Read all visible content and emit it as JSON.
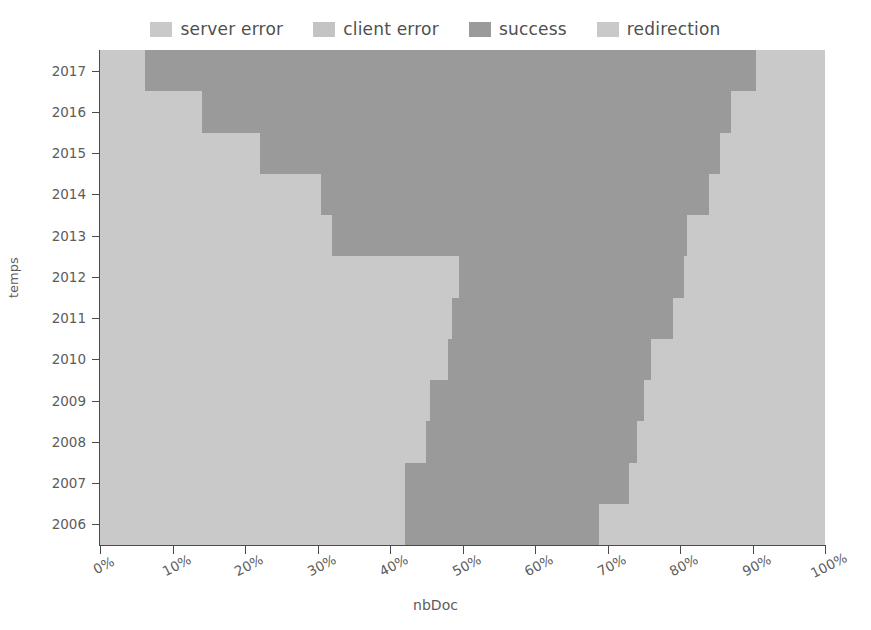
{
  "chart_data": {
    "type": "area",
    "subtype": "stacked-percentage-step-area-horizontal",
    "title": "",
    "xlabel": "nbDoc",
    "ylabel": "temps",
    "xlim": [
      0,
      100
    ],
    "x_unit": "%",
    "grid": false,
    "legend_position": "top-center",
    "orientation": "horizontal",
    "categories": [
      "2006",
      "2007",
      "2008",
      "2009",
      "2010",
      "2011",
      "2012",
      "2013",
      "2014",
      "2015",
      "2016",
      "2017"
    ],
    "xticks": [
      0,
      10,
      20,
      30,
      40,
      50,
      60,
      70,
      80,
      90,
      100
    ],
    "xticklabels": [
      "0%",
      "10%",
      "20%",
      "30%",
      "40%",
      "50%",
      "60%",
      "70%",
      "80%",
      "90%",
      "100%"
    ],
    "series": [
      {
        "name": "server error",
        "color": "#c9c9c9",
        "values": [
          42.0,
          42.0,
          45.0,
          45.5,
          48.0,
          48.5,
          49.5,
          32.0,
          30.5,
          22.0,
          14.0,
          6.2
        ]
      },
      {
        "name": "client error",
        "color": "#c0c0c0",
        "values": [
          0.0,
          0.0,
          0.0,
          0.0,
          0.0,
          0.0,
          0.0,
          0.0,
          0.0,
          0.0,
          0.0,
          0.0
        ]
      },
      {
        "name": "success",
        "color": "#9a9a9a",
        "values": [
          26.8,
          31.0,
          29.0,
          29.5,
          28.0,
          30.5,
          31.0,
          49.0,
          53.5,
          63.5,
          73.0,
          84.3
        ]
      },
      {
        "name": "redirection",
        "color": "#c9c9c9",
        "values": [
          31.2,
          27.0,
          26.0,
          25.0,
          24.0,
          21.0,
          19.5,
          19.0,
          16.0,
          14.5,
          13.0,
          9.5
        ]
      }
    ],
    "stack_boundaries": [
      {
        "year": "2017",
        "start": 6.2,
        "end": 90.5
      },
      {
        "year": "2016",
        "start": 14.0,
        "end": 87.0
      },
      {
        "year": "2015",
        "start": 22.0,
        "end": 85.5
      },
      {
        "year": "2014",
        "start": 30.5,
        "end": 84.0
      },
      {
        "year": "2013",
        "start": 32.0,
        "end": 81.0
      },
      {
        "year": "2012",
        "start": 49.5,
        "end": 80.5
      },
      {
        "year": "2011",
        "start": 48.5,
        "end": 79.0
      },
      {
        "year": "2010",
        "start": 48.0,
        "end": 76.0
      },
      {
        "year": "2009",
        "start": 45.5,
        "end": 75.0
      },
      {
        "year": "2008",
        "start": 45.0,
        "end": 74.0
      },
      {
        "year": "2007",
        "start": 42.0,
        "end": 73.0
      },
      {
        "year": "2006",
        "start": 42.0,
        "end": 68.8
      }
    ],
    "sub_steps": [
      {
        "year": "2017",
        "rows": [
          [
            0,
            6.2,
            "light"
          ],
          [
            6.2,
            90.5,
            "dark"
          ],
          [
            90.5,
            100,
            "light"
          ]
        ]
      },
      {
        "year": "2016",
        "rows": [
          [
            0,
            14.0,
            "light"
          ],
          [
            14.0,
            87.0,
            "dark"
          ],
          [
            87.0,
            100,
            "light"
          ]
        ]
      },
      {
        "year": "2015",
        "rows": [
          [
            0,
            22.0,
            "light"
          ],
          [
            22.0,
            85.5,
            "dark"
          ],
          [
            85.5,
            100,
            "light"
          ]
        ]
      },
      {
        "year": "2014",
        "rows": [
          [
            0,
            30.5,
            "light"
          ],
          [
            30.5,
            84.0,
            "dark"
          ],
          [
            84.0,
            100,
            "light"
          ]
        ]
      },
      {
        "year": "2013",
        "rows": [
          [
            0,
            32.0,
            "light"
          ],
          [
            32.0,
            81.0,
            "dark"
          ],
          [
            81.0,
            100,
            "light"
          ]
        ]
      },
      {
        "year": "2012",
        "rows": [
          [
            0,
            49.5,
            "light"
          ],
          [
            49.5,
            80.5,
            "dark"
          ],
          [
            80.5,
            100,
            "light"
          ]
        ]
      },
      {
        "year": "2011",
        "rows": [
          [
            0,
            48.5,
            "light"
          ],
          [
            48.5,
            79.0,
            "dark"
          ],
          [
            79.0,
            100,
            "light"
          ]
        ]
      },
      {
        "year": "2010",
        "rows": [
          [
            0,
            48.0,
            "light"
          ],
          [
            48.0,
            76.0,
            "dark"
          ],
          [
            76.0,
            100,
            "light"
          ]
        ]
      },
      {
        "year": "2009",
        "rows": [
          [
            0,
            45.5,
            "light"
          ],
          [
            45.5,
            75.0,
            "dark"
          ],
          [
            75.0,
            100,
            "light"
          ]
        ]
      },
      {
        "year": "2008",
        "rows": [
          [
            0,
            45.0,
            "light"
          ],
          [
            45.0,
            74.0,
            "dark"
          ],
          [
            74.0,
            100,
            "light"
          ]
        ]
      },
      {
        "year": "2007",
        "rows": [
          [
            0,
            42.0,
            "light"
          ],
          [
            42.0,
            73.0,
            "dark"
          ],
          [
            73.0,
            100,
            "light"
          ]
        ]
      },
      {
        "year": "2006",
        "rows": [
          [
            0,
            42.0,
            "light"
          ],
          [
            42.0,
            68.8,
            "dark"
          ],
          [
            68.8,
            100,
            "light"
          ]
        ]
      }
    ]
  },
  "legend": {
    "items": [
      {
        "label": "server error",
        "color": "#c9c9c9"
      },
      {
        "label": "client error",
        "color": "#c4c4c4"
      },
      {
        "label": "success",
        "color": "#9a9a9a"
      },
      {
        "label": "redirection",
        "color": "#c9c9c9"
      }
    ]
  },
  "axes": {
    "x_title": "nbDoc",
    "y_title": "temps",
    "x_ticklabels": [
      "0%",
      "10%",
      "20%",
      "30%",
      "40%",
      "50%",
      "60%",
      "70%",
      "80%",
      "90%",
      "100%"
    ],
    "y_ticklabels": [
      "2017",
      "2016",
      "2015",
      "2014",
      "2013",
      "2012",
      "2011",
      "2010",
      "2009",
      "2008",
      "2007",
      "2006"
    ]
  },
  "colors": {
    "light_band": "#c9c9c9",
    "dark_band": "#9a9a9a",
    "axis": "#4a4a4a",
    "text": "#5c5c5c",
    "background": "#ffffff"
  }
}
